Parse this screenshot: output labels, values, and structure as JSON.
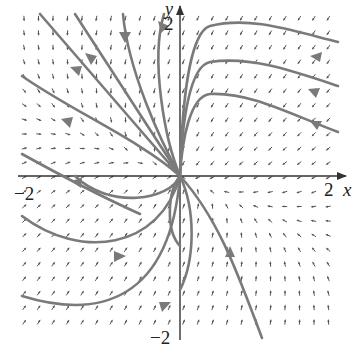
{
  "figure": {
    "type": "phase-portrait",
    "axis_labels": {
      "x": "x",
      "y": "y"
    },
    "tick_labels": {
      "x_min": "−2",
      "x_max": "2",
      "y_min": "−2",
      "y_max": "2"
    },
    "x_range": [
      -2,
      2
    ],
    "y_range": [
      -2,
      2
    ],
    "colors": {
      "trajectory": "#7a7a7a",
      "field_arrow": "#555555",
      "axis": "#333333",
      "background": "#ffffff"
    }
  },
  "chart_data": {
    "type": "phase-portrait",
    "title": "",
    "xlabel": "x",
    "ylabel": "y",
    "xlim": [
      -2.1,
      2.1
    ],
    "ylim": [
      -2.1,
      2.1
    ],
    "grid": false,
    "equilibrium": {
      "x": 0,
      "y": 0,
      "type": "stable node"
    },
    "trajectories": [
      {
        "id": "t1",
        "from": [
          -1.7,
          1.95
        ],
        "to": [
          0,
          0
        ],
        "direction": "toward origin"
      },
      {
        "id": "t2",
        "from": [
          -0.7,
          2.0
        ],
        "to": [
          0,
          0
        ],
        "direction": "toward origin"
      },
      {
        "id": "t3",
        "from": [
          -0.25,
          2.0
        ],
        "to": [
          0,
          0
        ],
        "direction": "toward origin"
      },
      {
        "id": "t4",
        "from": [
          -2.0,
          1.3
        ],
        "to": [
          0,
          0
        ],
        "direction": "toward origin"
      },
      {
        "id": "t5",
        "from": [
          -2.0,
          0.4
        ],
        "to": [
          0,
          0
        ],
        "direction": "toward origin"
      },
      {
        "id": "t6",
        "from": [
          2.0,
          1.4
        ],
        "to": [
          0,
          0
        ],
        "direction": "toward origin"
      },
      {
        "id": "t7",
        "from": [
          2.0,
          1.0
        ],
        "to": [
          0,
          0
        ],
        "direction": "toward origin"
      },
      {
        "id": "t8",
        "from": [
          2.0,
          0.6
        ],
        "to": [
          0,
          0
        ],
        "direction": "toward origin"
      },
      {
        "id": "t9",
        "from": [
          -2.0,
          -0.6
        ],
        "to": [
          0,
          0
        ],
        "direction": "toward origin"
      },
      {
        "id": "t10",
        "from": [
          -2.0,
          -1.5
        ],
        "to": [
          0,
          0
        ],
        "direction": "toward origin"
      },
      {
        "id": "t11",
        "from": [
          0.9,
          -2.0
        ],
        "to": [
          0,
          0
        ],
        "direction": "toward origin"
      }
    ]
  }
}
